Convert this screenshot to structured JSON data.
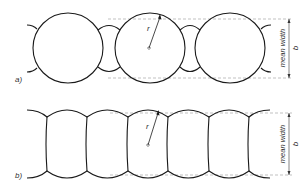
{
  "diagram_a": {
    "label": "a)",
    "radius_label": "r",
    "dimension_label": "mean width",
    "dimension_symbol": "b"
  },
  "diagram_b": {
    "label": "b)",
    "radius_label": "r",
    "dimension_label": "mean width",
    "dimension_symbol": "b"
  },
  "colors": {
    "stroke": "#1a1a1a",
    "dashed": "#999999",
    "text": "#333333",
    "background": "#ffffff"
  }
}
